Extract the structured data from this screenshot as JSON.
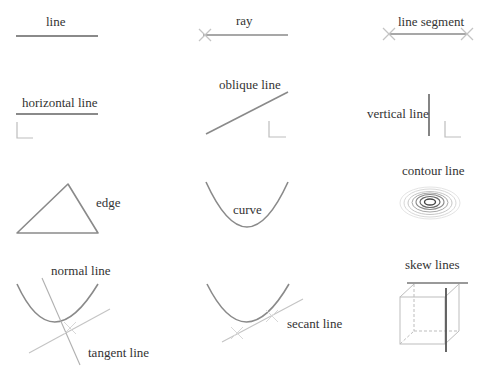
{
  "labels": {
    "line": "line",
    "ray": "ray",
    "line_segment": "line segment",
    "horizontal_line": "horizontal line",
    "oblique_line": "oblique line",
    "vertical_line": "vertical line",
    "edge": "edge",
    "curve": "curve",
    "contour_line": "contour line",
    "normal_line": "normal line",
    "tangent_line": "tangent line",
    "secant_line": "secant line",
    "skew_lines": "skew lines"
  },
  "colors": {
    "main_stroke": "#8a8a8a",
    "light_stroke": "#c4c4c4",
    "dark_stroke": "#555555",
    "text": "#333333"
  }
}
